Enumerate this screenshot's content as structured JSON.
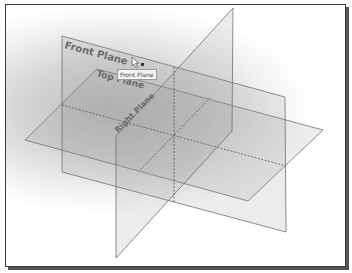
{
  "viewport": {
    "planes": [
      {
        "name": "Front Plane",
        "label": "Front Plane"
      },
      {
        "name": "Top Plane",
        "label": "Top Plane"
      },
      {
        "name": "Right Plane",
        "label": "Right Plane"
      }
    ],
    "tooltip": "Front Plane",
    "colors": {
      "edge": "#707070",
      "label": "#6a6a6a",
      "frame": "#3a3a3a"
    }
  }
}
